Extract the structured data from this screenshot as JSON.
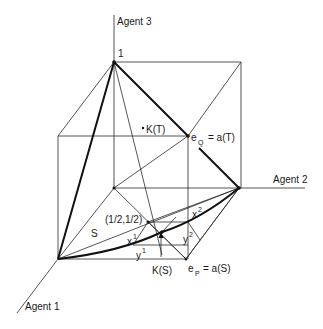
{
  "diagram": {
    "type": "3d-cube-bargaining-diagram",
    "axes": {
      "agent1": "Agent 1",
      "agent2": "Agent 2",
      "agent3": "Agent 3"
    },
    "labels": {
      "top_vertex": "1",
      "eq_base": "e",
      "eq_sub": "Q",
      "eq_rest": "= a(T)",
      "ep_base": "e",
      "ep_sub": "P",
      "ep_rest": "= a(S)",
      "kt": "K(T)",
      "ks": "K(S)",
      "half": "(1/2,1/2)",
      "s": "S",
      "x1_base": "x",
      "x1_sup": "1",
      "x2_base": "x",
      "x2_sup": "2",
      "y1_base": "y",
      "y1_sup": "1",
      "y2_base": "y",
      "y2_sup": "2"
    },
    "colors": {
      "line": "#2a2a2a",
      "bold_line": "#111111",
      "background": "#ffffff"
    }
  }
}
